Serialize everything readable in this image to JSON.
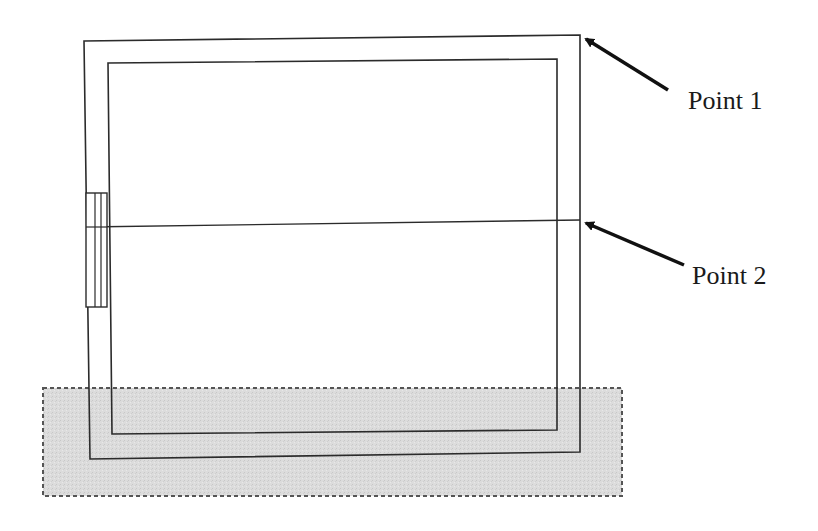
{
  "diagram": {
    "type": "architectural plan / section sketch",
    "labels": [
      {
        "id": "point-1",
        "text": "Point 1",
        "x": 688,
        "y": 88
      },
      {
        "id": "point-2",
        "text": "Point 2",
        "x": 692,
        "y": 263
      }
    ],
    "colors": {
      "stroke": "#2b2b2b",
      "ground_fill": "#dcdcdc",
      "ground_border": "#555555",
      "background": "#ffffff"
    },
    "elements": {
      "outer_wall": {
        "points": [
          [
            84,
            41
          ],
          [
            580,
            35
          ],
          [
            580,
            452
          ],
          [
            90,
            459
          ]
        ]
      },
      "inner_wall": {
        "points": [
          [
            108,
            63
          ],
          [
            557,
            59
          ],
          [
            557,
            430
          ],
          [
            112,
            434
          ]
        ]
      },
      "horizontal_line": {
        "from": [
          86,
          227
        ],
        "to": [
          580,
          220
        ]
      },
      "window": {
        "x1": 86,
        "x2": 107,
        "y1": 193,
        "y2": 307,
        "mullions": [
          95,
          101
        ]
      },
      "ground_area": {
        "x": 43,
        "y": 388,
        "width": 579,
        "height": 108
      },
      "arrows": [
        {
          "target": "point-1",
          "from": [
            668,
            90
          ],
          "to": [
            582,
            37
          ]
        },
        {
          "target": "point-2",
          "from": [
            684,
            265
          ],
          "to": [
            582,
            221
          ]
        }
      ]
    }
  }
}
